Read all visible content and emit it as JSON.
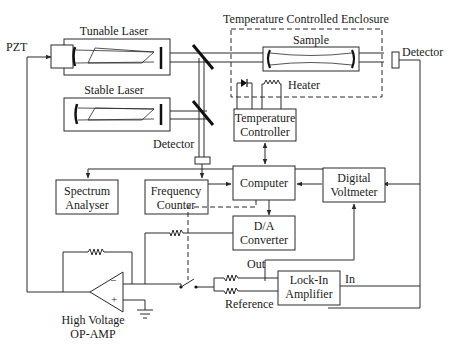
{
  "diagram": {
    "components": {
      "tunable_laser": "Tunable Laser",
      "stable_laser": "Stable Laser",
      "pzt": "PZT",
      "enclosure": "Temperature Controlled Enclosure",
      "sample": "Sample",
      "detector_right": "Detector",
      "detector_left": "Detector",
      "heater": "Heater",
      "temp_controller_line1": "Temperature",
      "temp_controller_line2": "Controller",
      "spectrum_analyser_line1": "Spectrum",
      "spectrum_analyser_line2": "Analyser",
      "frequency_counter_line1": "Frequency",
      "frequency_counter_line2": "Counter",
      "computer": "Computer",
      "digital_voltmeter_line1": "Digital",
      "digital_voltmeter_line2": "Voltmeter",
      "da_converter_line1": "D/A",
      "da_converter_line2": "Converter",
      "lockin_line1": "Lock-In",
      "lockin_line2": "Amplifier",
      "lockin_out": "Out",
      "lockin_in": "In",
      "lockin_reference": "Reference",
      "opamp_line1": "High Voltage",
      "opamp_line2": "OP-AMP",
      "opamp_minus": "−",
      "opamp_plus": "+"
    },
    "colors": {
      "line": "#2a2a2a",
      "background": "#ffffff"
    }
  }
}
